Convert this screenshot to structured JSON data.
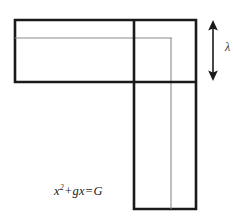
{
  "figure": {
    "name": "gnomon-geometric-diagram",
    "background_color": "#ffffff",
    "stroke_color_outer": "#1a1a1a",
    "stroke_color_inner": "#8a8a8a",
    "stroke_color_arrow": "#1a1a1a",
    "formula": {
      "base": "x",
      "exponent": "2",
      "rest": "+gx=G",
      "full_text": "x2+gx=G"
    },
    "dimension_label": "λ",
    "dimension_label_name": "lambda",
    "outer_shape": {
      "type": "L-shape-gnomon",
      "vertices": "15,20 196,20 196,209 134,209 134,82 15,82"
    },
    "inner_shape": {
      "type": "inner-corner-lines",
      "description": "thin L outline offset inward from top-left corner"
    },
    "arrow": {
      "type": "double-headed-vertical",
      "x": 213,
      "y_top": 21,
      "y_bottom": 80,
      "measures": "height of horizontal arm"
    }
  }
}
